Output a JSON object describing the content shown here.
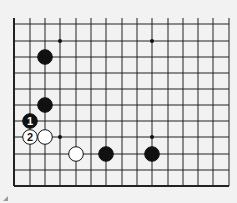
{
  "board": {
    "background": "#f2f2f2",
    "line_color": "#222222",
    "x_lines": [
      14,
      30,
      45,
      60,
      76,
      91,
      106,
      122,
      137,
      152,
      168,
      183,
      198,
      213,
      229
    ],
    "y_lines": [
      24,
      41,
      57,
      73,
      89,
      105,
      121,
      137,
      154,
      170,
      186
    ],
    "star_points": [
      [
        60,
        41
      ],
      [
        152,
        41
      ],
      [
        60,
        137
      ],
      [
        152,
        137
      ]
    ]
  },
  "stones": [
    {
      "color": "black",
      "x": 45,
      "y": 57,
      "label": ""
    },
    {
      "color": "black",
      "x": 45,
      "y": 105,
      "label": ""
    },
    {
      "color": "black",
      "x": 30,
      "y": 121,
      "label": "1"
    },
    {
      "color": "white",
      "x": 30,
      "y": 137,
      "label": "2"
    },
    {
      "color": "white",
      "x": 45,
      "y": 137,
      "label": ""
    },
    {
      "color": "white",
      "x": 76,
      "y": 154,
      "label": ""
    },
    {
      "color": "black",
      "x": 106,
      "y": 154,
      "label": ""
    },
    {
      "color": "black",
      "x": 152,
      "y": 154,
      "label": ""
    }
  ]
}
